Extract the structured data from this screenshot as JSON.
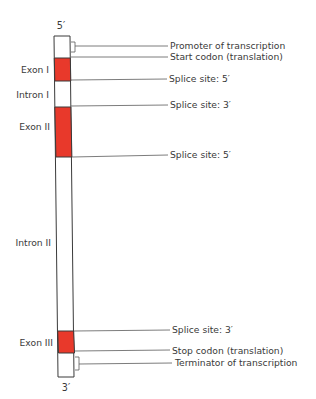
{
  "colors": {
    "exon": "#e8392b",
    "intron": "#ffffff",
    "stroke": "#3a3a3a",
    "leader": "#5a5a5a"
  },
  "ends": {
    "five_prime": "5′",
    "three_prime": "3′"
  },
  "segments": [
    {
      "type": "untranslated",
      "label": "",
      "y0": 36,
      "y1": 58
    },
    {
      "type": "exon",
      "label": "Exon I",
      "y0": 58,
      "y1": 81
    },
    {
      "type": "intron",
      "label": "Intron I",
      "y0": 81,
      "y1": 107
    },
    {
      "type": "exon",
      "label": "Exon II",
      "y0": 107,
      "y1": 157
    },
    {
      "type": "intron",
      "label": "Intron II",
      "y0": 157,
      "y1": 331
    },
    {
      "type": "exon",
      "label": "Exon III",
      "y0": 331,
      "y1": 353
    },
    {
      "type": "untranslated",
      "label": "",
      "y0": 353,
      "y1": 377
    }
  ],
  "left_labels": [
    {
      "text": "Exon I",
      "y": 73
    },
    {
      "text": "Intron I",
      "y": 98
    },
    {
      "text": "Exon II",
      "y": 130
    },
    {
      "text": "Intron II",
      "y": 246
    },
    {
      "text": "Exon III",
      "y": 346
    }
  ],
  "annotations": [
    {
      "text": "Promoter of transcription",
      "y": 46,
      "bracket": true
    },
    {
      "text": "Start codon (translation)",
      "y": 57,
      "bracket": false
    },
    {
      "text": "Splice site: 5′",
      "y": 80,
      "bracket": false
    },
    {
      "text": "Splice site: 3′",
      "y": 106,
      "bracket": false
    },
    {
      "text": "Splice site: 5′",
      "y": 156,
      "bracket": false
    },
    {
      "text": "Splice site: 3′",
      "y": 330,
      "bracket": false
    },
    {
      "text": "Stop codon (translation)",
      "y": 351,
      "bracket": false
    },
    {
      "text": "Terminator of transcription",
      "y": 364,
      "bracket": true
    }
  ]
}
